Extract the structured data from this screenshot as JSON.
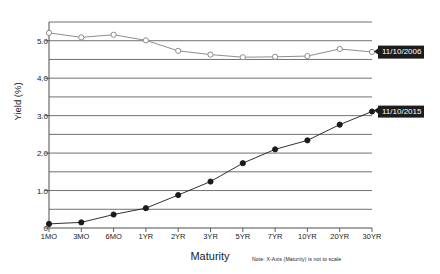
{
  "chart_data": {
    "type": "line",
    "title": "",
    "xlabel": "Maturity",
    "ylabel": "Yield (%)",
    "note": "Note: X-Axis (Maturity) is not to scale",
    "categories": [
      "1MO",
      "3MO",
      "6MO",
      "1YR",
      "2YR",
      "3YR",
      "5YR",
      "7YR",
      "10YR",
      "20YR",
      "30YR"
    ],
    "ylim": [
      0,
      5.5
    ],
    "yticks": [
      0,
      0.5,
      1.0,
      1.5,
      2.0,
      2.5,
      3.0,
      3.5,
      4.0,
      4.5,
      5.0,
      5.5
    ],
    "ytick_labels": [
      "0",
      "",
      "1.0",
      "",
      "2.0",
      "",
      "3.0",
      "",
      "4.0",
      "",
      "5.0",
      ""
    ],
    "grid": true,
    "legend_position": "right-inline-callout",
    "series": [
      {
        "name": "11/10/2006",
        "marker": "open-circle",
        "color": "#808080",
        "values": [
          5.21,
          5.09,
          5.16,
          5.01,
          4.73,
          4.63,
          4.56,
          4.57,
          4.59,
          4.78,
          4.7
        ]
      },
      {
        "name": "11/10/2015",
        "marker": "filled-circle",
        "color": "#1a1a1a",
        "values": [
          0.11,
          0.15,
          0.36,
          0.53,
          0.88,
          1.24,
          1.73,
          2.1,
          2.34,
          2.76,
          3.11
        ]
      }
    ]
  },
  "axis": {
    "y_title": "Yield (%)",
    "x_title": "Maturity"
  },
  "callouts": [
    {
      "label": "11/10/2006"
    },
    {
      "label": "11/10/2015"
    }
  ],
  "colors": {
    "series_2006": "#808080",
    "series_2015": "#1a1a1a",
    "grid": "#4d4d4d",
    "callout_bg": "#1c1c1c",
    "callout_text": "#ffffff"
  }
}
